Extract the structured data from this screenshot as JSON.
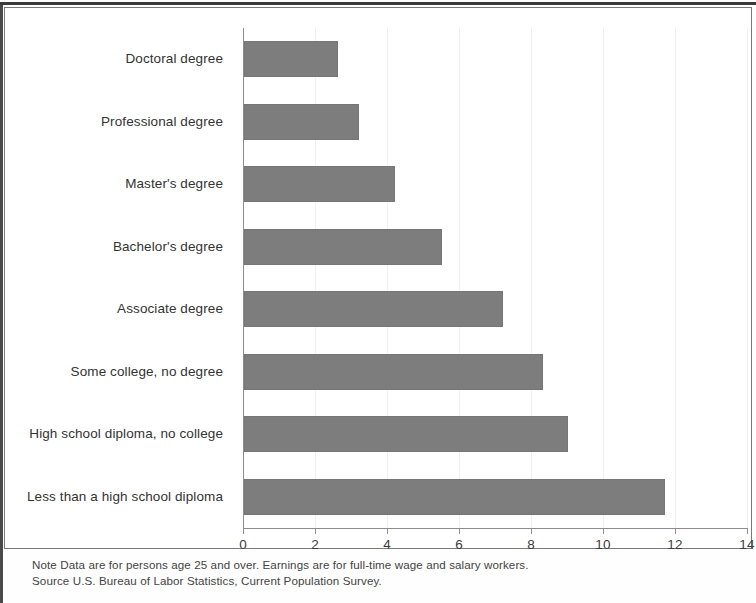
{
  "chart_data": {
    "type": "bar",
    "orientation": "horizontal",
    "title": "",
    "subtitle": "",
    "xlabel": "",
    "ylabel": "",
    "xlim": [
      0,
      14
    ],
    "ylim": null,
    "grid": true,
    "legend": null,
    "legend_position": "none",
    "bar_color": "#7d7d7d",
    "categories": [
      "Doctoral degree",
      "Professional degree",
      "Master's degree",
      "Bachelor's degree",
      "Associate degree",
      "Some college, no degree",
      "High school diploma, no college",
      "Less than a high school diploma"
    ],
    "values": [
      2.6,
      3.2,
      4.2,
      5.5,
      7.2,
      8.3,
      9.0,
      11.7
    ],
    "xticks": [
      0,
      2,
      4,
      6,
      8,
      10,
      12,
      14
    ],
    "xtick_labels": [
      "0",
      "2",
      "4",
      "6",
      "8",
      "10",
      "12",
      "14"
    ],
    "annotations": [
      "Note  Data are for persons age 25 and over. Earnings are for full-time wage and salary workers.",
      "Source  U.S. Bureau of Labor Statistics, Current Population Survey."
    ]
  },
  "footnotes": {
    "note": "Note  Data are for persons age 25 and over. Earnings are for full-time wage and salary workers.",
    "source": "Source  U.S. Bureau of Labor Statistics, Current Population Survey."
  }
}
